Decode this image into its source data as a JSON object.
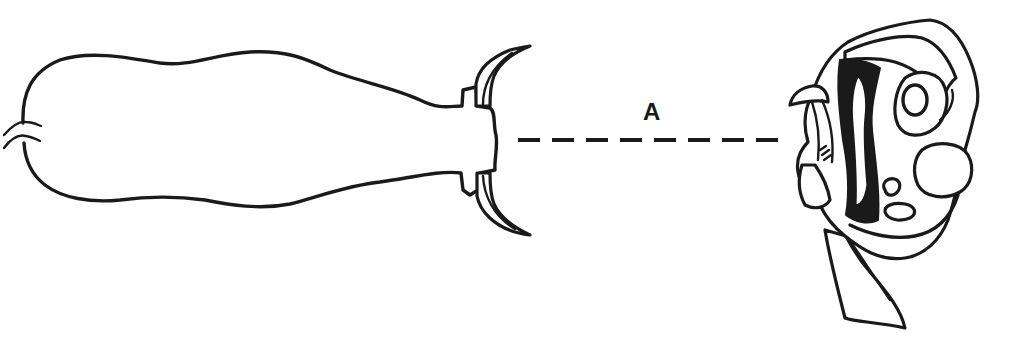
{
  "diagram": {
    "type": "scientific-line-illustration",
    "elements": [
      {
        "id": "left-specimen",
        "description": "elongated sac-like body with curved hook/horn appendages at right end and small coiled tip at left end"
      },
      {
        "id": "distance-line",
        "description": "horizontal dashed line connecting the two specimens"
      },
      {
        "id": "right-specimen",
        "description": "complex folded organism viewed end-on with dark inner folds, rounded lobes and trailing ribbon-like tail"
      }
    ],
    "distance_label": "A",
    "colors": {
      "ink": "#1a1a1a",
      "background": "#ffffff"
    }
  }
}
